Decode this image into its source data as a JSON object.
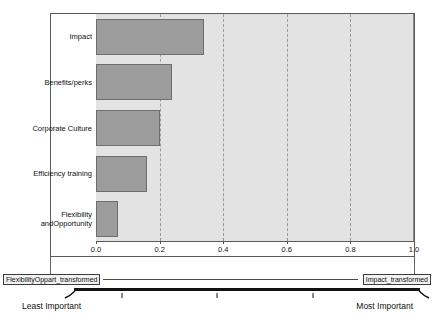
{
  "chart_data": {
    "type": "bar",
    "orientation": "horizontal",
    "title": "",
    "categories": [
      "Impact",
      "Benefits/perks",
      "Corporate Culture",
      "Efficiency training",
      "Flexibility\nandOpportunity"
    ],
    "values": [
      0.34,
      0.24,
      0.2,
      0.16,
      0.07
    ],
    "xlabel": "",
    "ylabel": "",
    "xlim": [
      0.0,
      1.0
    ],
    "x_ticks": [
      "0.0",
      "0.2",
      "0.4",
      "0.6",
      "0.8",
      "1.0"
    ],
    "gridline_values": [
      0.2,
      0.4,
      0.6,
      0.8
    ],
    "grid": "dashed-vertical",
    "legend": "none",
    "bar_color": "#9c9c9c",
    "bar_border_color": "#6e6e6e",
    "plot_background": "#e3e3e3"
  },
  "scale_strip": {
    "left_box_label": "FlexibilityOppart_transformed",
    "right_box_label": "Impact_transformed",
    "left_end_label": "Least Important",
    "right_end_label": "Most Important"
  }
}
